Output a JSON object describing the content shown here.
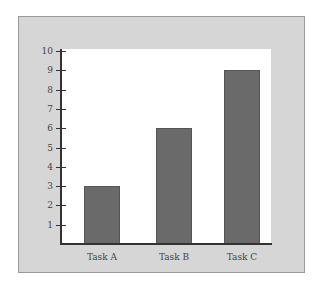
{
  "chart_data": {
    "type": "bar",
    "title": "",
    "xlabel": "",
    "ylabel": "",
    "categories": [
      "Task A",
      "Task B",
      "Task C"
    ],
    "values": [
      3,
      6,
      9
    ],
    "ylim": [
      0,
      10
    ],
    "yticks": [
      1,
      2,
      3,
      4,
      5,
      6,
      7,
      8,
      9,
      10
    ],
    "grid": false,
    "legend": null,
    "colors": {
      "bar": "#6a6a6a",
      "panel": "#d6d6d6",
      "plot_bg": "#ffffff",
      "axis": "#333333"
    }
  },
  "yticks_labels": [
    "1",
    "2",
    "3",
    "4",
    "5",
    "6",
    "7",
    "8",
    "9",
    "10"
  ],
  "xlabels": [
    "Task A",
    "Task B",
    "Task C"
  ]
}
